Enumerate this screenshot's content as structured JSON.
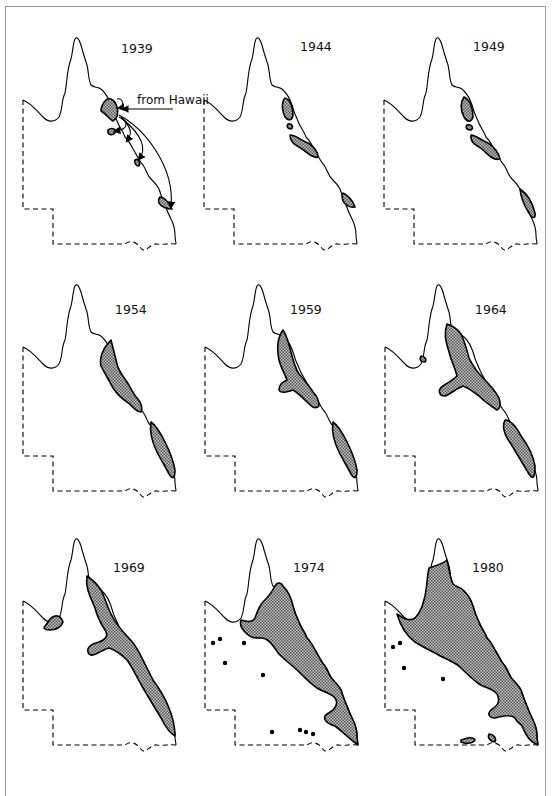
{
  "figure": {
    "type": "small-multiples distribution map",
    "region_outline": "state outline with coastline (solid) and land borders (dashed)",
    "fill_color": "#a9a9a9",
    "line_color": "#000000",
    "frame_color": "#9a9a9a"
  },
  "annotation": {
    "label": "from Hawaii",
    "panel": "1939"
  },
  "panels": [
    {
      "year": "1939",
      "spots": 0
    },
    {
      "year": "1944",
      "spots": 0
    },
    {
      "year": "1949",
      "spots": 0
    },
    {
      "year": "1954",
      "spots": 0
    },
    {
      "year": "1959",
      "spots": 0
    },
    {
      "year": "1964",
      "spots": 0
    },
    {
      "year": "1969",
      "spots": 0
    },
    {
      "year": "1974",
      "spots": 9
    },
    {
      "year": "1980",
      "spots": 4
    }
  ]
}
